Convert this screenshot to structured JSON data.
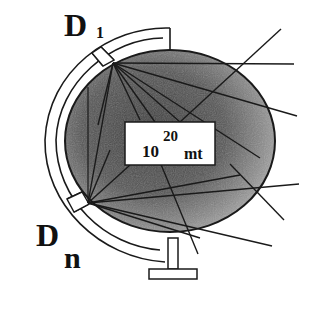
{
  "diagram": {
    "labels": {
      "d1_main": "D",
      "d1_sub": "1",
      "dn_main": "D",
      "dn_sub": "n"
    },
    "center_box": {
      "base": "10",
      "exponent": "20",
      "unit": "mt"
    },
    "colors": {
      "globe_fill_dark": "#4a4a4a",
      "globe_fill_light": "#9a9a9a",
      "stroke": "#1a1a1a",
      "background": "#ffffff"
    }
  }
}
